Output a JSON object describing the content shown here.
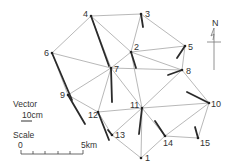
{
  "points": [
    {
      "id": "1",
      "x": 141,
      "y": 158,
      "lx": 145,
      "ly": 161
    },
    {
      "id": "2",
      "x": 131,
      "y": 52,
      "lx": 134,
      "ly": 50
    },
    {
      "id": "3",
      "x": 141,
      "y": 14,
      "lx": 145,
      "ly": 17
    },
    {
      "id": "4",
      "x": 91,
      "y": 16,
      "lx": 83,
      "ly": 17
    },
    {
      "id": "5",
      "x": 185,
      "y": 46,
      "lx": 188,
      "ly": 50
    },
    {
      "id": "6",
      "x": 52,
      "y": 53,
      "lx": 44,
      "ly": 56
    },
    {
      "id": "7",
      "x": 111,
      "y": 68,
      "lx": 114,
      "ly": 72
    },
    {
      "id": "8",
      "x": 182,
      "y": 70,
      "lx": 186,
      "ly": 74
    },
    {
      "id": "9",
      "x": 68,
      "y": 95,
      "lx": 60,
      "ly": 98
    },
    {
      "id": "10",
      "x": 209,
      "y": 103,
      "lx": 211,
      "ly": 107
    },
    {
      "id": "11",
      "x": 142,
      "y": 108,
      "lx": 130,
      "ly": 108
    },
    {
      "id": "12",
      "x": 98,
      "y": 112,
      "lx": 88,
      "ly": 118
    },
    {
      "id": "13",
      "x": 112,
      "y": 135,
      "lx": 115,
      "ly": 138
    },
    {
      "id": "14",
      "x": 165,
      "y": 136,
      "lx": 163,
      "ly": 146
    },
    {
      "id": "15",
      "x": 198,
      "y": 138,
      "lx": 200,
      "ly": 146
    }
  ],
  "edges": [
    [
      "4",
      "3"
    ],
    [
      "4",
      "6"
    ],
    [
      "4",
      "7"
    ],
    [
      "4",
      "2"
    ],
    [
      "3",
      "2"
    ],
    [
      "3",
      "5"
    ],
    [
      "2",
      "7"
    ],
    [
      "2",
      "5"
    ],
    [
      "2",
      "8"
    ],
    [
      "2",
      "11"
    ],
    [
      "6",
      "7"
    ],
    [
      "6",
      "9"
    ],
    [
      "7",
      "9"
    ],
    [
      "7",
      "12"
    ],
    [
      "7",
      "11"
    ],
    [
      "7",
      "8"
    ],
    [
      "5",
      "8"
    ],
    [
      "8",
      "10"
    ],
    [
      "8",
      "11"
    ],
    [
      "9",
      "12"
    ],
    [
      "12",
      "11"
    ],
    [
      "12",
      "13"
    ],
    [
      "13",
      "11"
    ],
    [
      "13",
      "1"
    ],
    [
      "11",
      "1"
    ],
    [
      "11",
      "14"
    ],
    [
      "11",
      "10"
    ],
    [
      "14",
      "10"
    ],
    [
      "14",
      "1"
    ],
    [
      "14",
      "15"
    ],
    [
      "15",
      "10"
    ]
  ],
  "vectors": [
    {
      "from": "4",
      "x1": 91,
      "y1": 16,
      "x2": 109,
      "y2": 66
    },
    {
      "from": "3",
      "x1": 141,
      "y1": 14,
      "x2": 143,
      "y2": 27
    },
    {
      "from": "2",
      "x1": 131,
      "y1": 52,
      "x2": 136,
      "y2": 68
    },
    {
      "from": "5",
      "x1": 185,
      "y1": 46,
      "x2": 177,
      "y2": 58
    },
    {
      "from": "8",
      "x1": 182,
      "y1": 70,
      "x2": 168,
      "y2": 75
    },
    {
      "from": "7",
      "x1": 111,
      "y1": 68,
      "x2": 112,
      "y2": 102
    },
    {
      "from": "6",
      "x1": 52,
      "y1": 53,
      "x2": 72,
      "y2": 100
    },
    {
      "from": "9",
      "x1": 68,
      "y1": 95,
      "x2": 85,
      "y2": 124
    },
    {
      "from": "12",
      "x1": 98,
      "y1": 112,
      "x2": 109,
      "y2": 140
    },
    {
      "from": "11",
      "x1": 142,
      "y1": 108,
      "x2": 139,
      "y2": 134
    },
    {
      "from": "10",
      "x1": 209,
      "y1": 103,
      "x2": 187,
      "y2": 92
    },
    {
      "from": "14",
      "x1": 165,
      "y1": 136,
      "x2": 155,
      "y2": 121
    },
    {
      "from": "15",
      "x1": 198,
      "y1": 138,
      "x2": 195,
      "y2": 127
    },
    {
      "from": "13",
      "x1": 112,
      "y1": 135,
      "x2": 108,
      "y2": 130
    }
  ],
  "north_arrow": {
    "label": "N"
  },
  "legend": {
    "vector_title": "Vector",
    "vector_scale": "10cm",
    "scale_title": "Scale",
    "scale_start": "0",
    "scale_end": "5km"
  },
  "colors": {
    "edge": "#9a9a9a",
    "vector": "#2a2a2a",
    "text": "#333333"
  }
}
